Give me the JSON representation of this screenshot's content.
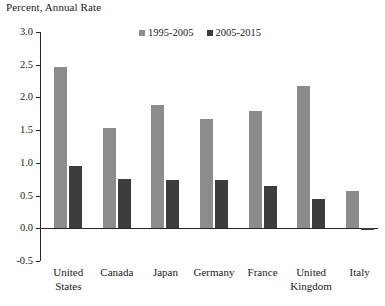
{
  "chart_data": {
    "type": "bar",
    "title": "Percent, Annual Rate",
    "xlabel": "",
    "ylabel": "",
    "ylim": [
      -0.5,
      3.0
    ],
    "yticks": [
      "3.0",
      "2.5",
      "2.0",
      "1.5",
      "1.0",
      "0.5",
      "0.0",
      "-0.5"
    ],
    "ytick_values": [
      3.0,
      2.5,
      2.0,
      1.5,
      1.0,
      0.5,
      0.0,
      -0.5
    ],
    "grid": false,
    "legend_position": "top-center",
    "categories": [
      "United States",
      "Canada",
      "Japan",
      "Germany",
      "France",
      "United Kingdom",
      "Italy"
    ],
    "category_lines": [
      [
        "United",
        "States"
      ],
      [
        "Canada",
        ""
      ],
      [
        "Japan",
        ""
      ],
      [
        "Germany",
        ""
      ],
      [
        "France",
        ""
      ],
      [
        "United",
        "Kingdom"
      ],
      [
        "Italy",
        ""
      ]
    ],
    "series": [
      {
        "name": "1995-2005",
        "color": "#8c8c8c",
        "values": [
          2.47,
          1.53,
          1.88,
          1.67,
          1.8,
          2.17,
          0.57
        ]
      },
      {
        "name": "2005-2015",
        "color": "#3d3d3d",
        "values": [
          0.96,
          0.75,
          0.74,
          0.74,
          0.65,
          0.45,
          -0.02
        ]
      }
    ]
  },
  "legend": {
    "items": [
      {
        "label": "1995-2005",
        "color": "#8c8c8c"
      },
      {
        "label": "2005-2015",
        "color": "#3d3d3d"
      }
    ]
  },
  "axis": {
    "title": "Percent, Annual Rate"
  }
}
